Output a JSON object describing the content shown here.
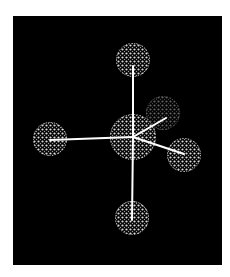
{
  "viewer": {
    "background": "#000000",
    "bond_color": "#ffffff",
    "atom_dot_color": "#d8d8d8"
  },
  "molecule": {
    "geometry": "octahedral-like (5 ligands shown)",
    "central_atom": {
      "cx": 120,
      "cy": 121,
      "r": 23,
      "opacity": 1.0
    },
    "ligands": [
      {
        "id": "top",
        "cx": 120,
        "cy": 44,
        "r": 17,
        "opacity": 1.0,
        "bond_end": [
          120,
          50
        ]
      },
      {
        "id": "bottom",
        "cx": 119,
        "cy": 202,
        "r": 17,
        "opacity": 1.0,
        "bond_end": [
          119,
          204
        ]
      },
      {
        "id": "left",
        "cx": 37,
        "cy": 123,
        "r": 17,
        "opacity": 1.0,
        "bond_end": [
          37,
          124
        ]
      },
      {
        "id": "back-right",
        "cx": 150,
        "cy": 97,
        "r": 17,
        "opacity": 0.45,
        "bond_end": [
          153,
          102
        ]
      },
      {
        "id": "front-right",
        "cx": 171,
        "cy": 139,
        "r": 17,
        "opacity": 1.0,
        "bond_end": [
          171,
          138
        ]
      }
    ]
  }
}
